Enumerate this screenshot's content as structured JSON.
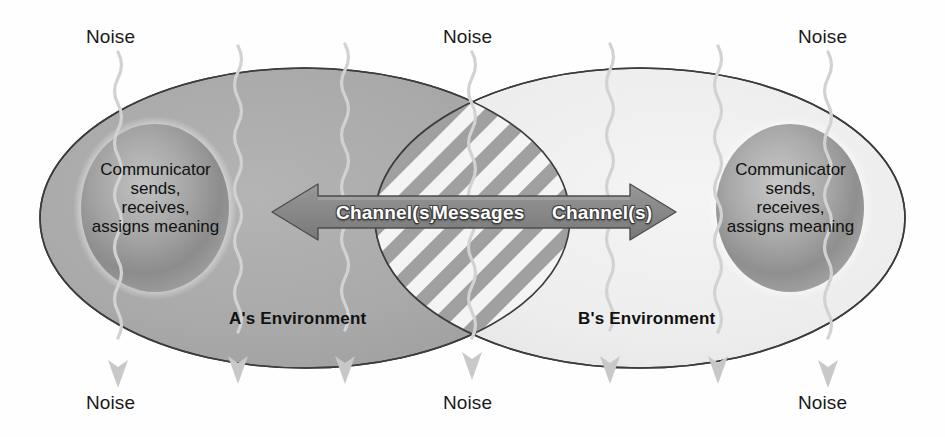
{
  "diagram": {
    "background_color": "#fefefe",
    "environments": [
      {
        "id": "a",
        "label": "A's Environment",
        "fill_color": "#a9a9a9",
        "stroke_color": "#3c3c3c",
        "label_x": 300,
        "label_y": 318
      },
      {
        "id": "b",
        "label": "B's Environment",
        "fill_color": "#eeeeee",
        "stroke_color": "#3c3c3c",
        "label_x": 645,
        "label_y": 318
      }
    ],
    "communicators": [
      {
        "id": "a",
        "lines": [
          "Communicator",
          "sends,",
          "receives,",
          "assigns meaning"
        ],
        "center_x": 155,
        "center_y": 208,
        "fill_color": "#9a9a9a"
      },
      {
        "id": "b",
        "lines": [
          "Communicator",
          "sends,",
          "receives,",
          "assigns meaning"
        ],
        "center_x": 790,
        "center_y": 208,
        "fill_color": "#9a9a9a"
      }
    ],
    "overlap": {
      "name": "shared-meaning-overlap",
      "stripe_color": "#a0a0a0",
      "stripe_gap_color": "#f4f4f4",
      "stripe_angle_degrees": 45
    },
    "arrow_band": {
      "fill_color": "#8a8a8a",
      "stroke_color": "#4a4a4a",
      "left_tip_x": 272,
      "right_tip_x": 676,
      "center_y": 212,
      "labels": [
        {
          "text": "Channel(s)",
          "x": 336,
          "align": "left"
        },
        {
          "text": "Messages",
          "x": 432,
          "align": "left"
        },
        {
          "text": "Channel(s)",
          "x": 552,
          "align": "left"
        }
      ]
    },
    "noise": {
      "line_color": "#d2d2d2",
      "arrow_color": "#c8c8c8",
      "label": "Noise",
      "top_labels": [
        {
          "text": "Noise",
          "x": 86,
          "y": 26
        },
        {
          "text": "Noise",
          "x": 443,
          "y": 26
        },
        {
          "text": "Noise",
          "x": 798,
          "y": 26
        }
      ],
      "bottom_labels": [
        {
          "text": "Noise",
          "x": 86,
          "y": 392
        },
        {
          "text": "Noise",
          "x": 443,
          "y": 392
        },
        {
          "text": "Noise",
          "x": 798,
          "y": 392
        }
      ],
      "line_x_positions": [
        118,
        238,
        345,
        472,
        610,
        718,
        828
      ]
    }
  }
}
